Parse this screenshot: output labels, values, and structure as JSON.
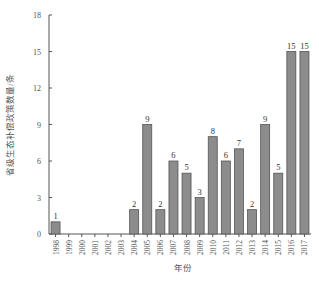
{
  "chart_data": {
    "type": "bar",
    "title": "",
    "xlabel": "年份",
    "ylabel": "省级生态补偿政策数量/条",
    "ylim": [
      0,
      18
    ],
    "yticks": [
      0,
      3,
      6,
      9,
      12,
      15,
      18
    ],
    "grid": false,
    "legend": null,
    "categories": [
      "1998",
      "1999",
      "2000",
      "2001",
      "2002",
      "2003",
      "2004",
      "2005",
      "2006",
      "2007",
      "2008",
      "2009",
      "2010",
      "2011",
      "2012",
      "2013",
      "2014",
      "2015",
      "2016",
      "2017"
    ],
    "values": [
      1,
      0,
      0,
      0,
      0,
      0,
      2,
      9,
      2,
      6,
      5,
      3,
      8,
      6,
      7,
      2,
      9,
      5,
      15,
      15
    ],
    "data_labels": [
      "1",
      "",
      "",
      "",
      "",
      "",
      "2",
      "9",
      "2",
      "6",
      "5",
      "3",
      "8",
      "6",
      "7",
      "2",
      "9",
      "5",
      "15",
      "15"
    ],
    "colors": {
      "bar_fill": "#8c8c8c",
      "bar_stroke": "#555555",
      "axis": "#555555"
    }
  }
}
